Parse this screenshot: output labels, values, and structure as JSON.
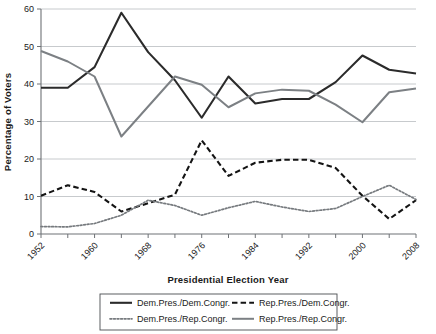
{
  "chart_data": {
    "type": "line",
    "title": "",
    "xlabel": "Presidential Election Year",
    "ylabel": "Percentage of Voters",
    "xlim": [
      1952,
      2008
    ],
    "ylim": [
      0,
      60
    ],
    "ytick_step": 10,
    "grid": true,
    "legend_position": "bottom",
    "x": [
      1952,
      1956,
      1960,
      1964,
      1968,
      1972,
      1976,
      1980,
      1984,
      1988,
      1992,
      1996,
      2000,
      2004,
      2008
    ],
    "xtick_labels": [
      "1952",
      "1960",
      "1968",
      "1976",
      "1984",
      "1992",
      "2000",
      "2008"
    ],
    "xtick_values": [
      1952,
      1960,
      1968,
      1976,
      1984,
      1992,
      2000,
      2008
    ],
    "ytick_labels": [
      "0",
      "10",
      "20",
      "30",
      "40",
      "50",
      "60"
    ],
    "ytick_values": [
      0,
      10,
      20,
      30,
      40,
      50,
      60
    ],
    "series": [
      {
        "name": "Dem.Pres./Dem.Congr.",
        "style": "solid",
        "color": "#2b2b2b",
        "width": 2.1,
        "values": [
          39.0,
          39.0,
          44.5,
          59.0,
          48.5,
          41.0,
          31.0,
          42.0,
          34.8,
          36.0,
          36.0,
          40.5,
          47.6,
          43.8,
          42.8
        ]
      },
      {
        "name": "Rep.Pres./Dem.Congr.",
        "style": "dashed",
        "color": "#141414",
        "width": 2.1,
        "values": [
          10.2,
          13.0,
          11.2,
          6.0,
          8.2,
          10.5,
          25.0,
          15.5,
          19.0,
          19.8,
          19.8,
          17.6,
          10.2,
          4.0,
          9.0
        ]
      },
      {
        "name": "Dem.Pres./Rep.Congr.",
        "style": "dotted",
        "color": "#767a7e",
        "width": 1.7,
        "values": [
          2.0,
          1.9,
          2.8,
          5.0,
          9.0,
          7.6,
          5.0,
          7.0,
          8.7,
          7.2,
          6.0,
          6.8,
          10.0,
          13.0,
          9.2
        ]
      },
      {
        "name": "Rep.Pres./Rep.Congr.",
        "style": "solid",
        "color": "#7c8084",
        "width": 2.0,
        "values": [
          48.8,
          46.0,
          42.0,
          26.0,
          34.0,
          42.0,
          39.8,
          33.8,
          37.5,
          38.5,
          38.2,
          34.5,
          29.8,
          37.8,
          38.8
        ]
      }
    ]
  },
  "legend": {
    "entries": [
      {
        "label": "Dem.Pres./Dem.Congr.",
        "style": "solid",
        "color": "#2b2b2b"
      },
      {
        "label": "Rep.Pres./Dem.Congr.",
        "style": "dashed",
        "color": "#141414"
      },
      {
        "label": "Dem.Pres./Rep.Congr.",
        "style": "dotted",
        "color": "#767a7e"
      },
      {
        "label": "Rep.Pres./Rep.Congr.",
        "style": "solid",
        "color": "#7c8084"
      }
    ]
  },
  "colors": {
    "grid": "#b9bcc0",
    "axis": "#6e7276",
    "text": "#1a1a1a",
    "background": "#ffffff"
  }
}
